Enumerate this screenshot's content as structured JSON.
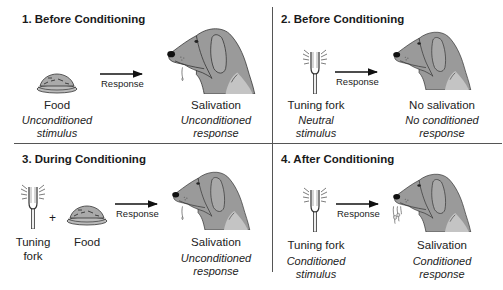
{
  "figure": {
    "colors": {
      "dog_fill": "#9a9a9a",
      "dog_light": "#c4c4c4",
      "outline": "#333333",
      "divider": "#555555",
      "text": "#1a1a1a"
    }
  },
  "panels": [
    {
      "title": "1. Before Conditioning",
      "stimulus": [
        {
          "icon": "food-bowl-icon",
          "label": "Food"
        }
      ],
      "stimulus_caption": [
        "Unconditioned",
        "stimulus"
      ],
      "arrow_label": "Response",
      "outcome_icon": "dog-salivating-icon",
      "outcome_label": "Salivation",
      "outcome_caption": [
        "Unconditioned",
        "response"
      ]
    },
    {
      "title": "2. Before Conditioning",
      "stimulus": [
        {
          "icon": "tuning-fork-icon",
          "label": "Tuning fork"
        }
      ],
      "stimulus_caption": [
        "Neutral",
        "stimulus"
      ],
      "arrow_label": "Response",
      "outcome_icon": "dog-icon",
      "outcome_label": "No salivation",
      "outcome_caption": [
        "No conditioned",
        "response"
      ]
    },
    {
      "title": "3. During Conditioning",
      "stimulus": [
        {
          "icon": "tuning-fork-icon",
          "label": "Tuning",
          "label2": "fork"
        },
        {
          "icon": "food-bowl-icon",
          "label": "Food"
        }
      ],
      "plus": "+",
      "arrow_label": "Response",
      "outcome_icon": "dog-salivating-icon",
      "outcome_label": "Salivation",
      "outcome_caption": [
        "Unconditioned",
        "response"
      ]
    },
    {
      "title": "4. After Conditioning",
      "stimulus": [
        {
          "icon": "tuning-fork-icon",
          "label": "Tuning fork"
        }
      ],
      "stimulus_caption": [
        "Conditioned",
        "stimulus"
      ],
      "arrow_label": "Response",
      "outcome_icon": "dog-salivating-heavy-icon",
      "outcome_label": "Salivation",
      "outcome_caption": [
        "Conditioned",
        "response"
      ]
    }
  ]
}
